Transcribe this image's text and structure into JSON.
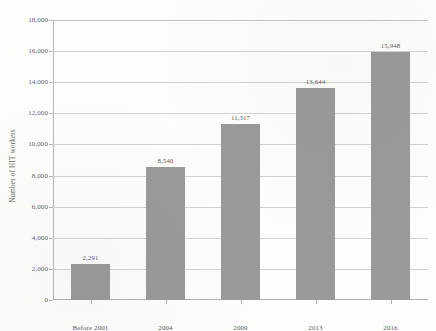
{
  "chart_data": {
    "type": "bar",
    "title": "",
    "xlabel": "",
    "ylabel": "Number of HIT workers",
    "categories": [
      "Before 2001",
      "2004",
      "2009",
      "2013",
      "2016"
    ],
    "values": [
      2291,
      8540,
      11317,
      13644,
      15948
    ],
    "value_labels": [
      "2,291",
      "8,540",
      "11,317",
      "13,644",
      "15,948"
    ],
    "ylim": [
      0,
      18000
    ],
    "ytick_labels": [
      "0",
      "2,000",
      "4,000",
      "6,000",
      "8,000",
      "10,000",
      "12,000",
      "14,000",
      "16,000",
      "18,000"
    ],
    "ytick_values": [
      0,
      2000,
      4000,
      6000,
      8000,
      10000,
      12000,
      14000,
      16000,
      18000
    ],
    "grid": true,
    "legend": "none",
    "bar_color": "#9a9a98",
    "grid_color": "#d2d2d0",
    "axis_color": "#b0b0ae",
    "text_color": "#5d5d5b"
  }
}
